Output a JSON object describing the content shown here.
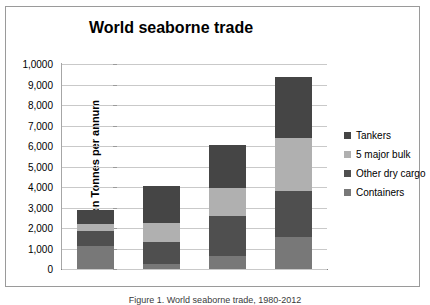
{
  "chart_data": {
    "type": "bar",
    "stacked": true,
    "title": "World seaborne trade",
    "xlabel": "",
    "ylabel": "Billion Tonnes per annum",
    "categories": [
      "1980",
      "1990",
      "2000",
      "2012"
    ],
    "ylim": [
      0,
      10000
    ],
    "ytick_values": [
      0,
      1000,
      2000,
      3000,
      4000,
      5000,
      6000,
      7000,
      8000,
      9000,
      10000
    ],
    "ytick_labels": [
      "0",
      "1,000",
      "2,000",
      "3,000",
      "4,000",
      "5,000",
      "6,000",
      "7,000",
      "8,000",
      "9,000",
      "1,0000"
    ],
    "grid": true,
    "legend_position": "right",
    "series": [
      {
        "name": "Containers",
        "color": "#787878",
        "values": [
          1100,
          250,
          650,
          1550
        ]
      },
      {
        "name": "Other dry cargo",
        "color": "#4f4f4f",
        "values": [
          750,
          1050,
          1950,
          2250
        ]
      },
      {
        "name": "5 major bulk",
        "color": "#b0b0b0",
        "values": [
          350,
          950,
          1350,
          2600
        ]
      },
      {
        "name": "Tankers",
        "color": "#454545",
        "values": [
          700,
          1780,
          2100,
          2950
        ]
      }
    ],
    "series_totals": [
      2900,
      4030,
      6050,
      9350
    ],
    "legend_order": [
      "Tankers",
      "5 major bulk",
      "Other dry cargo",
      "Containers"
    ]
  },
  "caption": "Figure 1. World seaborne trade, 1980-2012"
}
